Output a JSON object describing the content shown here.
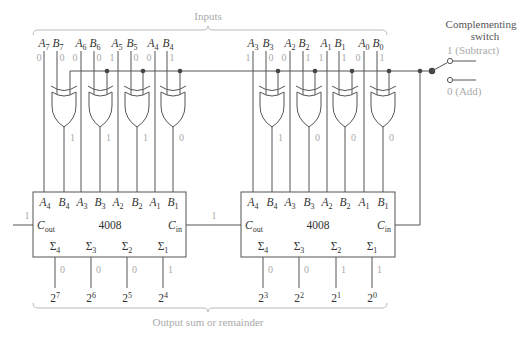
{
  "inputs_label": "Inputs",
  "output_label": "Output sum or remainder",
  "switch": {
    "title_line1": "Complementing",
    "title_line2": "switch",
    "subtract_label": "1 (Subtract)",
    "add_label": "0 (Add)",
    "selected": "1 (Subtract)"
  },
  "bits": [
    {
      "a": "A",
      "a_sub": "7",
      "b": "B",
      "b_sub": "7",
      "a_val": "0",
      "b_val": "0",
      "xor_out": "1"
    },
    {
      "a": "A",
      "a_sub": "6",
      "b": "B",
      "b_sub": "6",
      "a_val": "0",
      "b_val": "0",
      "xor_out": "1"
    },
    {
      "a": "A",
      "a_sub": "5",
      "b": "B",
      "b_sub": "5",
      "a_val": "1",
      "b_val": "0",
      "xor_out": "1"
    },
    {
      "a": "A",
      "a_sub": "4",
      "b": "B",
      "b_sub": "4",
      "a_val": "0",
      "b_val": "1",
      "xor_out": "0"
    },
    {
      "a": "A",
      "a_sub": "3",
      "b": "B",
      "b_sub": "3",
      "a_val": "1",
      "b_val": "0",
      "xor_out": "1"
    },
    {
      "a": "A",
      "a_sub": "2",
      "b": "B",
      "b_sub": "2",
      "a_val": "0",
      "b_val": "1",
      "xor_out": "0"
    },
    {
      "a": "A",
      "a_sub": "1",
      "b": "B",
      "b_sub": "1",
      "a_val": "1",
      "b_val": "1",
      "xor_out": "0"
    },
    {
      "a": "A",
      "a_sub": "0",
      "b": "B",
      "b_sub": "0",
      "a_val": "0",
      "b_val": "1",
      "xor_out": "0"
    }
  ],
  "adders": [
    {
      "chip": "4008",
      "pins": [
        {
          "n": "A",
          "s": "4"
        },
        {
          "n": "B",
          "s": "4"
        },
        {
          "n": "A",
          "s": "3"
        },
        {
          "n": "B",
          "s": "3"
        },
        {
          "n": "A",
          "s": "2"
        },
        {
          "n": "B",
          "s": "2"
        },
        {
          "n": "A",
          "s": "1"
        },
        {
          "n": "B",
          "s": "1"
        }
      ],
      "cout": {
        "n": "C",
        "s": "out"
      },
      "cin": {
        "n": "C",
        "s": "in"
      },
      "sums": [
        {
          "n": "Σ",
          "s": "4"
        },
        {
          "n": "Σ",
          "s": "3"
        },
        {
          "n": "Σ",
          "s": "2"
        },
        {
          "n": "Σ",
          "s": "1"
        }
      ]
    },
    {
      "chip": "4008",
      "pins": [
        {
          "n": "A",
          "s": "4"
        },
        {
          "n": "B",
          "s": "4"
        },
        {
          "n": "A",
          "s": "3"
        },
        {
          "n": "B",
          "s": "3"
        },
        {
          "n": "A",
          "s": "2"
        },
        {
          "n": "B",
          "s": "2"
        },
        {
          "n": "A",
          "s": "1"
        },
        {
          "n": "B",
          "s": "1"
        }
      ],
      "cout": {
        "n": "C",
        "s": "out"
      },
      "cin": {
        "n": "C",
        "s": "in"
      },
      "sums": [
        {
          "n": "Σ",
          "s": "4"
        },
        {
          "n": "Σ",
          "s": "3"
        },
        {
          "n": "Σ",
          "s": "2"
        },
        {
          "n": "Σ",
          "s": "1"
        }
      ]
    }
  ],
  "carries": {
    "final_cout": "1",
    "intermediate": "1"
  },
  "outputs": [
    {
      "base": "2",
      "exp": "7",
      "value": "0"
    },
    {
      "base": "2",
      "exp": "6",
      "value": "0"
    },
    {
      "base": "2",
      "exp": "5",
      "value": "0"
    },
    {
      "base": "2",
      "exp": "4",
      "value": "1"
    },
    {
      "base": "2",
      "exp": "3",
      "value": "0"
    },
    {
      "base": "2",
      "exp": "2",
      "value": "0"
    },
    {
      "base": "2",
      "exp": "1",
      "value": "1"
    },
    {
      "base": "2",
      "exp": "0",
      "value": "1"
    }
  ],
  "colors": {
    "line": "#555555",
    "value_text": "#aaaaaa",
    "label_text": "#333333"
  }
}
